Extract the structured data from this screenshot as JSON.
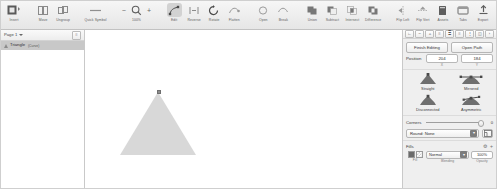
{
  "toolbar": {
    "items": [
      {
        "label": "Insert",
        "icon": "insert-icon",
        "active": false,
        "sep_after": true
      },
      {
        "label": "Move",
        "icon": "move-icon",
        "active": false,
        "sep_after": false
      },
      {
        "label": "Ungroup",
        "icon": "ungroup-icon",
        "active": false,
        "sep_after": true
      },
      {
        "label": "Quick Symbol",
        "icon": "quick-symbol-icon",
        "active": false,
        "sep_after": true
      }
    ],
    "zoom": {
      "minus": "−",
      "plus": "+",
      "label": "100%",
      "icon": "magnifier-icon"
    },
    "items2": [
      {
        "label": "Edit",
        "icon": "edit-node-icon",
        "active": true,
        "sep_after": false
      },
      {
        "label": "Reverse",
        "icon": "reverse-icon",
        "active": false,
        "sep_after": false
      },
      {
        "label": "Rotate",
        "icon": "rotate-icon",
        "active": false,
        "sep_after": false
      },
      {
        "label": "Flatten",
        "icon": "flatten-icon",
        "active": false,
        "sep_after": true
      },
      {
        "label": "Open",
        "icon": "open-curve-icon",
        "active": false,
        "sep_after": false
      },
      {
        "label": "Break",
        "icon": "break-curve-icon",
        "active": false,
        "sep_after": true
      },
      {
        "label": "Union",
        "icon": "union-icon",
        "active": false,
        "sep_after": false
      },
      {
        "label": "Subtract",
        "icon": "subtract-icon",
        "active": false,
        "sep_after": false
      },
      {
        "label": "Intersect",
        "icon": "intersect-icon",
        "active": false,
        "sep_after": false
      },
      {
        "label": "Difference",
        "icon": "difference-icon",
        "active": false,
        "sep_after": true
      },
      {
        "label": "Flip Left",
        "icon": "flip-left-icon",
        "active": false,
        "sep_after": false
      },
      {
        "label": "Flip Vert",
        "icon": "flip-vert-icon",
        "active": false,
        "sep_after": true
      }
    ],
    "items3": [
      {
        "label": "Assets",
        "icon": "assets-icon",
        "active": false
      },
      {
        "label": "Tabs",
        "icon": "tabs-icon",
        "active": false
      },
      {
        "label": "Export",
        "icon": "export-icon",
        "active": false
      }
    ]
  },
  "left_panel": {
    "page_selector": "Page 1",
    "page_menu_glyph": "≡",
    "layers": [
      {
        "name": "Triangle",
        "badge": "(Curve)",
        "icon": "triangle-shape-icon",
        "selected": true
      }
    ]
  },
  "canvas": {
    "shape": "triangle",
    "fill_color": "#d8d8d8",
    "node_selected": true
  },
  "right_panel": {
    "context_buttons": [
      {
        "icon": "node-sharp-icon"
      },
      {
        "icon": "node-smooth-icon"
      },
      {
        "icon": "node-smart-icon"
      },
      {
        "icon": "align-left-icon"
      },
      {
        "icon": "align-center-icon"
      },
      {
        "icon": "align-right-icon"
      },
      {
        "icon": "distribute-icon"
      },
      {
        "icon": "transform-icon"
      },
      {
        "icon": "more-icon"
      }
    ],
    "finish_editing_label": "Finish Editing",
    "open_path_label": "Open Path",
    "position": {
      "label": "Position",
      "x_value": "204",
      "x_caption": "X",
      "y_value": "184",
      "y_caption": "Y"
    },
    "node_types": [
      {
        "label": "Straight",
        "icon": "node-straight-icon"
      },
      {
        "label": "Mirrored",
        "icon": "node-mirrored-icon"
      },
      {
        "label": "Disconnected",
        "icon": "node-disconnected-icon"
      },
      {
        "label": "Asymmetric",
        "icon": "node-asymmetric-icon"
      }
    ],
    "corners": {
      "label": "Corners",
      "value": "0",
      "style_label": "Round: None",
      "dropdown_glyph": "▾",
      "apply_icon": "corner-apply-icon"
    },
    "fills": {
      "title": "Fills",
      "header_icons": [
        {
          "icon": "fill-settings-icon",
          "glyph": "⚙"
        },
        {
          "icon": "fill-add-icon",
          "glyph": "+"
        }
      ],
      "fill_caption": "Fill",
      "blending_value": "Normal",
      "blending_caption": "Blending",
      "blending_arrow": "▾",
      "opacity_value": "100%",
      "opacity_caption": "Opacity"
    }
  }
}
